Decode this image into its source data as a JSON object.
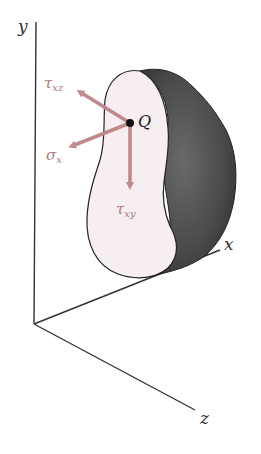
{
  "figure": {
    "axes": {
      "y": {
        "label": "y"
      },
      "x": {
        "label": "x"
      },
      "z": {
        "label": "z"
      }
    },
    "point": {
      "label": "Q"
    },
    "stresses": [
      {
        "id": "tau_xz",
        "symbol": "τ",
        "subscript": "xz",
        "direction": "up-left (toward -x/-z in plane)"
      },
      {
        "id": "sigma_x",
        "symbol": "σ",
        "subscript": "x",
        "direction": "left, normal to section"
      },
      {
        "id": "tau_xy",
        "symbol": "τ",
        "subscript": "xy",
        "direction": "down (-y)"
      }
    ],
    "colors": {
      "arrow": "#c08a8c",
      "stress_label": "#b07a7c",
      "body_face": "#f6eef0",
      "body_side": "#4a4a4a",
      "axis": "#333333"
    }
  }
}
